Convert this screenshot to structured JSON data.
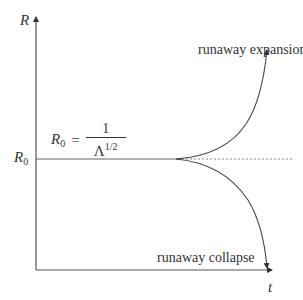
{
  "axes": {
    "y_label": "R",
    "x_label": "t",
    "y_tick_label": {
      "base": "R",
      "sub": "0"
    }
  },
  "formula": {
    "lhs_base": "R",
    "lhs_sub": "0",
    "equals": "=",
    "numerator": "1",
    "denominator_base": "Λ",
    "denominator_exp": "1/2"
  },
  "annotations": {
    "expansion": "runaway expansion",
    "collapse": "runaway collapse"
  },
  "colors": {
    "line": "#555555",
    "text": "#333333",
    "background": "#ffffff"
  },
  "geometry": {
    "origin": [
      36,
      270
    ],
    "y_axis_top": 15,
    "x_axis_right": 272,
    "r0_level_y": 159,
    "branch_x": 180,
    "dotted_end_x": 290
  }
}
